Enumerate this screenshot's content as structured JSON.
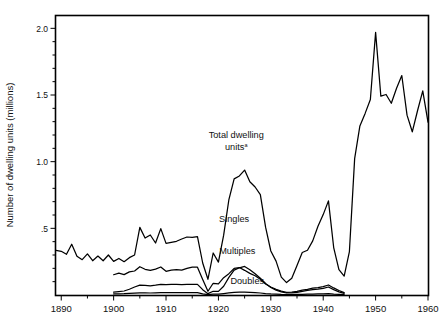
{
  "chart_data": {
    "type": "line",
    "title": "",
    "xlabel": "",
    "ylabel": "Number of dwelling units (millions)",
    "xlim": [
      1889,
      1960
    ],
    "ylim": [
      0,
      2.1
    ],
    "grid": false,
    "legend_position": "inline-annotations",
    "y_ticks_major": [
      "2.0",
      "1.5",
      "1.0",
      ".5"
    ],
    "y_tick_major_values": [
      2.0,
      1.5,
      1.0,
      0.5
    ],
    "y_tick_minor_step": 0.1,
    "x_ticks_major": [
      "1890",
      "1900",
      "1910",
      "1920",
      "1930",
      "1940",
      "1950",
      "1960"
    ],
    "x_tick_major_values": [
      1890,
      1900,
      1910,
      1920,
      1930,
      1940,
      1950,
      1960
    ],
    "x_tick_minor_step": 5,
    "annotations": [
      {
        "name": "total-dwelling-units",
        "line1": "Total dwelling",
        "line2": "units",
        "superscript": "a",
        "x": 1923.4,
        "y": 1.18
      },
      {
        "name": "singles",
        "text": "Singles",
        "x": 1923.0,
        "y": 0.545
      },
      {
        "name": "multiples",
        "text": "Multiples",
        "x": 1923.6,
        "y": 0.305
      },
      {
        "name": "doubles",
        "text": "Doubles",
        "x": 1925.5,
        "y": 0.085
      }
    ],
    "series": [
      {
        "name": "Total dwelling units",
        "x": [
          1889,
          1890,
          1891,
          1892,
          1893,
          1894,
          1895,
          1896,
          1897,
          1898,
          1899,
          1900,
          1901,
          1902,
          1903,
          1904,
          1905,
          1906,
          1907,
          1908,
          1909,
          1910,
          1911,
          1912,
          1913,
          1914,
          1915,
          1916,
          1917,
          1918,
          1919,
          1920,
          1921,
          1922,
          1923,
          1924,
          1925,
          1926,
          1927,
          1928,
          1929,
          1930,
          1931,
          1932,
          1933,
          1934,
          1935,
          1936,
          1937,
          1938,
          1939,
          1940,
          1941,
          1942,
          1943,
          1944,
          1945,
          1946,
          1947,
          1948,
          1949,
          1950,
          1951,
          1952,
          1953,
          1954,
          1955,
          1956,
          1957,
          1958,
          1959,
          1960
        ],
        "values": [
          0.335,
          0.328,
          0.305,
          0.381,
          0.29,
          0.265,
          0.308,
          0.257,
          0.292,
          0.257,
          0.3,
          0.252,
          0.274,
          0.25,
          0.28,
          0.3,
          0.507,
          0.427,
          0.45,
          0.39,
          0.498,
          0.387,
          0.395,
          0.403,
          0.42,
          0.435,
          0.433,
          0.437,
          0.24,
          0.118,
          0.315,
          0.247,
          0.449,
          0.716,
          0.871,
          0.893,
          0.937,
          0.849,
          0.81,
          0.753,
          0.509,
          0.33,
          0.254,
          0.134,
          0.093,
          0.126,
          0.221,
          0.319,
          0.336,
          0.406,
          0.515,
          0.603,
          0.706,
          0.356,
          0.191,
          0.142,
          0.326,
          1.023,
          1.268,
          1.362,
          1.466,
          1.97,
          1.491,
          1.504,
          1.438,
          1.551,
          1.646,
          1.349,
          1.224,
          1.382,
          1.531,
          1.296
        ]
      },
      {
        "name": "Singles",
        "x": [
          1900,
          1901,
          1902,
          1903,
          1904,
          1905,
          1906,
          1907,
          1908,
          1909,
          1910,
          1911,
          1912,
          1913,
          1914,
          1915,
          1916,
          1917,
          1918,
          1919,
          1920,
          1921,
          1922,
          1923,
          1924,
          1925,
          1926,
          1927,
          1928,
          1929,
          1930,
          1931,
          1932,
          1933,
          1934,
          1935,
          1936,
          1937,
          1938,
          1939,
          1940,
          1941,
          1942,
          1943,
          1944
        ],
        "values": [
          0.152,
          0.164,
          0.153,
          0.173,
          0.18,
          0.212,
          0.193,
          0.184,
          0.194,
          0.21,
          0.178,
          0.186,
          0.191,
          0.186,
          0.2,
          0.209,
          0.209,
          0.117,
          0.028,
          0.088,
          0.083,
          0.13,
          0.16,
          0.199,
          0.206,
          0.185,
          0.162,
          0.144,
          0.118,
          0.082,
          0.06,
          0.042,
          0.029,
          0.02,
          0.022,
          0.028,
          0.036,
          0.043,
          0.052,
          0.056,
          0.063,
          0.075,
          0.053,
          0.034,
          0.018
        ]
      },
      {
        "name": "Multiples",
        "x": [
          1900,
          1901,
          1902,
          1903,
          1904,
          1905,
          1906,
          1907,
          1908,
          1909,
          1910,
          1911,
          1912,
          1913,
          1914,
          1915,
          1916,
          1917,
          1918,
          1919,
          1920,
          1921,
          1922,
          1923,
          1924,
          1925,
          1926,
          1927,
          1928,
          1929,
          1930,
          1931,
          1932,
          1933,
          1934,
          1935,
          1936,
          1937,
          1938,
          1939,
          1940,
          1941,
          1942,
          1943,
          1944
        ],
        "values": [
          0.022,
          0.026,
          0.03,
          0.043,
          0.06,
          0.074,
          0.072,
          0.069,
          0.074,
          0.08,
          0.078,
          0.079,
          0.08,
          0.078,
          0.079,
          0.08,
          0.08,
          0.04,
          0.01,
          0.028,
          0.027,
          0.066,
          0.132,
          0.187,
          0.204,
          0.214,
          0.19,
          0.16,
          0.126,
          0.086,
          0.056,
          0.036,
          0.024,
          0.015,
          0.016,
          0.02,
          0.027,
          0.034,
          0.04,
          0.044,
          0.05,
          0.06,
          0.04,
          0.024,
          0.012
        ]
      },
      {
        "name": "Doubles",
        "x": [
          1900,
          1901,
          1902,
          1903,
          1904,
          1905,
          1906,
          1907,
          1908,
          1909,
          1910,
          1911,
          1912,
          1913,
          1914,
          1915,
          1916,
          1917,
          1918,
          1919,
          1920,
          1921,
          1922,
          1923,
          1924,
          1925,
          1926,
          1927,
          1928,
          1929,
          1930,
          1931,
          1932,
          1933,
          1934,
          1935,
          1936,
          1937,
          1938,
          1939,
          1940,
          1941,
          1942,
          1943,
          1944
        ],
        "values": [
          0.008,
          0.009,
          0.01,
          0.012,
          0.014,
          0.016,
          0.016,
          0.015,
          0.016,
          0.017,
          0.017,
          0.017,
          0.017,
          0.017,
          0.017,
          0.017,
          0.017,
          0.009,
          0.003,
          0.006,
          0.006,
          0.011,
          0.016,
          0.02,
          0.021,
          0.021,
          0.019,
          0.017,
          0.015,
          0.011,
          0.008,
          0.006,
          0.004,
          0.003,
          0.003,
          0.004,
          0.005,
          0.006,
          0.007,
          0.008,
          0.009,
          0.01,
          0.007,
          0.005,
          0.003
        ]
      }
    ]
  },
  "axis": {
    "y_title": "Number of dwelling units (millions)"
  }
}
